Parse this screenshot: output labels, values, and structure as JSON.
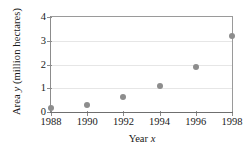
{
  "chart_data": {
    "type": "scatter",
    "title": "",
    "xlabel": "Year x",
    "xlabel_prefix": "Year ",
    "xlabel_var": "x",
    "ylabel": "Area y  (million hectares)",
    "ylabel_prefix": "Area ",
    "ylabel_var": "y",
    "ylabel_suffix": "  (million hectares)",
    "x": [
      1988,
      1990,
      1992,
      1994,
      1996,
      1998
    ],
    "values": [
      0.15,
      0.3,
      0.65,
      1.1,
      1.9,
      3.2
    ],
    "xticks": [
      "1988",
      "1990",
      "1992",
      "1994",
      "1996",
      "1998"
    ],
    "yticks": [
      "0",
      "1",
      "2",
      "3",
      "4"
    ],
    "ytick_values": [
      0,
      1,
      2,
      3,
      4
    ],
    "xlim": [
      1988,
      1998
    ],
    "ylim": [
      0,
      4
    ],
    "grid": "horizontal",
    "legend": "none",
    "marker_color": "#8d8d8d",
    "axis_color": "#8c8c8c",
    "grid_color": "#e6e6e6"
  }
}
